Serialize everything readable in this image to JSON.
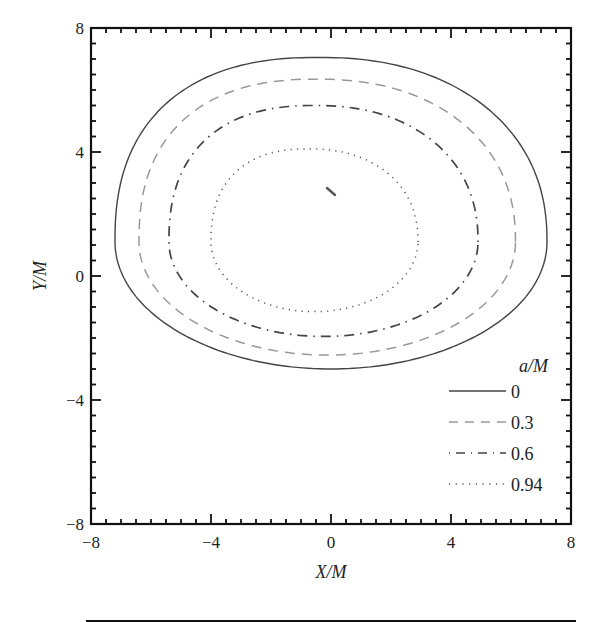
{
  "chart_data": {
    "type": "line",
    "title": "",
    "xlabel": "X/M",
    "ylabel": "Y/M",
    "xlim": [
      -8,
      8
    ],
    "ylim": [
      -8,
      8
    ],
    "xticks": [
      -8,
      -4,
      0,
      4,
      8
    ],
    "yticks": [
      -8,
      -4,
      0,
      4,
      8
    ],
    "xtick_labels": [
      "−8",
      "−4",
      "0",
      "4",
      "8"
    ],
    "ytick_labels": [
      "−8",
      "−4",
      "0",
      "4",
      "8"
    ],
    "minor_tick_step": 0.5,
    "grid": false,
    "legend": {
      "title": "a/M",
      "position": "lower right",
      "entries": [
        {
          "label": "0",
          "style": "solid"
        },
        {
          "label": "0.3",
          "style": "dashed"
        },
        {
          "label": "0.6",
          "style": "dashdot"
        },
        {
          "label": "0.94",
          "style": "dotted"
        }
      ]
    },
    "series": [
      {
        "name": "0",
        "style": "solid",
        "color": "#444444",
        "shape": {
          "x_min": -7.2,
          "x_max": 7.2,
          "y_min": -3.0,
          "y_max": 7.05,
          "y_at_x_extremes": 1.1
        }
      },
      {
        "name": "0.3",
        "style": "dashed",
        "color": "#999999",
        "shape": {
          "x_min": -6.4,
          "x_max": 6.15,
          "y_min": -2.55,
          "y_max": 6.35,
          "y_at_x_extremes": 1.1
        }
      },
      {
        "name": "0.6",
        "style": "dashdot",
        "color": "#444444",
        "shape": {
          "x_min": -5.4,
          "x_max": 4.9,
          "y_min": -1.95,
          "y_max": 5.5,
          "y_at_x_extremes": 1.1
        }
      },
      {
        "name": "0.94",
        "style": "dotted",
        "color": "#555555",
        "shape": {
          "x_min": -4.0,
          "x_max": 2.9,
          "y_min": -1.15,
          "y_max": 4.1,
          "y_at_x_extremes": 1.1
        }
      }
    ],
    "annotations": [
      {
        "type": "mark",
        "x": 0.0,
        "y": 2.7,
        "description": "small dash marker near center"
      }
    ]
  }
}
